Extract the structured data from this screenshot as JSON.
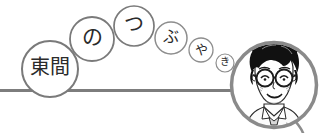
{
  "canvas": {
    "width": 321,
    "height": 133,
    "background": "#ffffff"
  },
  "colors": {
    "stroke": "#7a7a7a",
    "stroke_light": "#8d8d8d",
    "text": "#2b2b2b",
    "portrait_ink": "#1a1a1a",
    "portrait_fill": "#ffffff",
    "baseline": "#7d7d7d"
  },
  "banner": {
    "title_text": "東間のつぶやき",
    "baseline_label": "horizontal-rule"
  },
  "bubbles": [
    {
      "char": "東間",
      "cx": 50,
      "cy": 69,
      "r": 28,
      "stroke_width": 2.0
    },
    {
      "char": "の",
      "cx": 92,
      "cy": 39,
      "r": 22,
      "stroke_width": 1.8
    },
    {
      "char": "つ",
      "cx": 134,
      "cy": 26,
      "r": 20,
      "stroke_width": 1.7
    },
    {
      "char": "ぶ",
      "cx": 171,
      "cy": 38,
      "r": 16,
      "stroke_width": 1.5
    },
    {
      "char": "や",
      "cx": 201,
      "cy": 50,
      "r": 12,
      "stroke_width": 1.3
    },
    {
      "char": "き",
      "cx": 225,
      "cy": 63,
      "r": 9,
      "stroke_width": 1.2
    }
  ],
  "portrait": {
    "label": "author-portrait",
    "alt": "manga-style portrait of a smiling person with curly black hair and round glasses",
    "cx": 274,
    "cy": 85,
    "r": 44,
    "ring_width": 3.5
  },
  "tail": {
    "label": "portrait-tail-curve"
  }
}
